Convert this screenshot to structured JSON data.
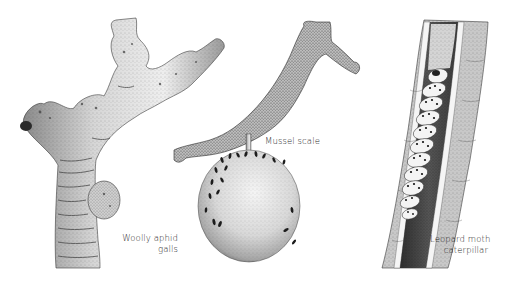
{
  "figure": {
    "panels": [
      {
        "id": "woolly-aphid",
        "subject": "branch with galls",
        "label_lines": [
          "Woolly aphid",
          "galls"
        ]
      },
      {
        "id": "mussel-scale",
        "subject": "twig and apple covered in scale insects",
        "label_lines": [
          "Mussel scale"
        ]
      },
      {
        "id": "leopard-moth",
        "subject": "caterpillar tunnelling inside a split branch",
        "label_lines": [
          "Leopard moth",
          "caterpillar"
        ]
      }
    ],
    "colors": {
      "background": "#ffffff",
      "ink": "#1e1e1e",
      "bark_light": "#e2e2e2",
      "bark_mid": "#b5b5b5",
      "bark_dark": "#5a5a5a",
      "label": "#2a2a2a"
    }
  }
}
